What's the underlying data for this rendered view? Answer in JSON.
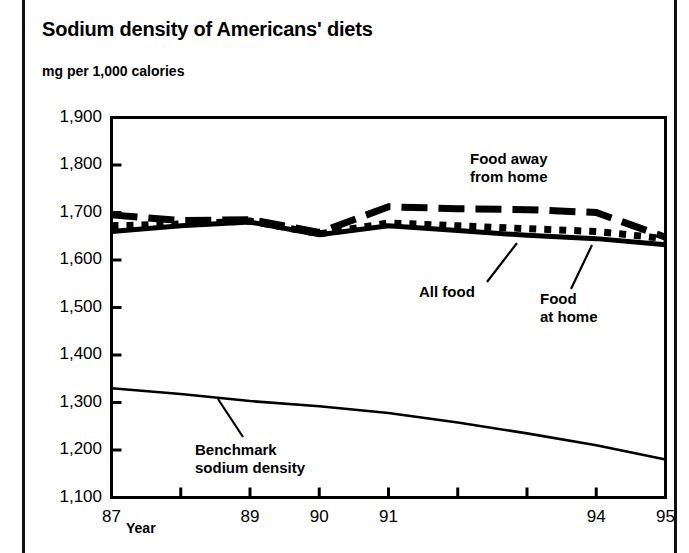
{
  "chart_title": "Sodium density of Americans' diets",
  "axis_unit_label": "mg per 1,000 calories",
  "x_axis_name": "Year",
  "y_ticks": [
    "1,900",
    "1,800",
    "1,700",
    "1,600",
    "1,500",
    "1,400",
    "1,300",
    "1,200",
    "1,100"
  ],
  "x_ticks": [
    "87",
    "",
    "89",
    "90",
    "91",
    "",
    "",
    "94",
    "95"
  ],
  "x_tick_labels_visible": [
    "87",
    "89",
    "90",
    "91",
    "94",
    "95"
  ],
  "annotations": {
    "food_away_line1": "Food away",
    "food_away_line2": "from home",
    "all_food": "All food",
    "food_at_home_line1": "Food",
    "food_at_home_line2": "at home",
    "benchmark_line1": "Benchmark",
    "benchmark_line2": "sodium density"
  },
  "colors": {
    "ink": "#000000",
    "background": "#ffffff",
    "rule": "#111111"
  },
  "chart_data": {
    "type": "line",
    "title": "Sodium density of Americans' diets",
    "subtitle": "mg per 1,000 calories",
    "xlabel": "Year",
    "ylabel": "mg per 1,000 calories",
    "x": [
      87,
      88,
      89,
      90,
      91,
      92,
      93,
      94,
      95
    ],
    "xlim": [
      87,
      95
    ],
    "ylim": [
      1100,
      1900
    ],
    "y_tick_values": [
      1100,
      1200,
      1300,
      1400,
      1500,
      1600,
      1700,
      1800,
      1900
    ],
    "x_tick_values": [
      87,
      88,
      89,
      90,
      91,
      92,
      93,
      94,
      95
    ],
    "grid": false,
    "legend": "inline annotations",
    "series": [
      {
        "name": "Food away from home",
        "style": "long-dashed",
        "values": [
          1695,
          1683,
          1685,
          1658,
          1712,
          1708,
          1706,
          1700,
          1648
        ]
      },
      {
        "name": "All food",
        "style": "dotted",
        "values": [
          1672,
          1676,
          1682,
          1655,
          1678,
          1672,
          1666,
          1660,
          1645
        ]
      },
      {
        "name": "Food at home",
        "style": "solid-thick",
        "values": [
          1660,
          1672,
          1680,
          1653,
          1672,
          1662,
          1652,
          1645,
          1632
        ]
      },
      {
        "name": "Benchmark sodium density",
        "style": "solid-thin",
        "values": [
          1330,
          1318,
          1303,
          1292,
          1278,
          1258,
          1235,
          1210,
          1180
        ]
      }
    ]
  }
}
